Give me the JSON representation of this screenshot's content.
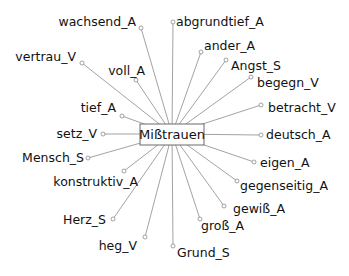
{
  "diagram": {
    "type": "collocation-network",
    "center": {
      "label": "Mißtrauen",
      "x": 172,
      "y": 134,
      "box": {
        "x": 140,
        "y": 124,
        "w": 64,
        "h": 21
      }
    },
    "colors": {
      "edge": "#8a8a8a",
      "node": "#8a8a8a",
      "text": "#111111",
      "box_border": "#6a6a6a"
    },
    "nodes": [
      {
        "label": "abgrundtief_A",
        "x": 173,
        "y": 22,
        "lx": 176,
        "ly": 26,
        "anchor": "start"
      },
      {
        "label": "wachsend_A",
        "x": 141,
        "y": 28,
        "lx": 136,
        "ly": 26,
        "anchor": "end"
      },
      {
        "label": "vertrau_V",
        "x": 82,
        "y": 63,
        "lx": 76,
        "ly": 61,
        "anchor": "end"
      },
      {
        "label": "voll_A",
        "x": 136,
        "y": 80,
        "lx": 145,
        "ly": 75,
        "anchor": "end"
      },
      {
        "label": "ander_A",
        "x": 201,
        "y": 52,
        "lx": 204,
        "ly": 50,
        "anchor": "start"
      },
      {
        "label": "Angst_S",
        "x": 226,
        "y": 60,
        "lx": 231,
        "ly": 70,
        "anchor": "start"
      },
      {
        "label": "begegn_V",
        "x": 251,
        "y": 77,
        "lx": 257,
        "ly": 87,
        "anchor": "start"
      },
      {
        "label": "betracht_V",
        "x": 261,
        "y": 105,
        "lx": 268,
        "ly": 112,
        "anchor": "start"
      },
      {
        "label": "tief_A",
        "x": 122,
        "y": 116,
        "lx": 116,
        "ly": 112,
        "anchor": "end"
      },
      {
        "label": "setz_V",
        "x": 103,
        "y": 134,
        "lx": 97,
        "ly": 138,
        "anchor": "end"
      },
      {
        "label": "deutsch_A",
        "x": 261,
        "y": 135,
        "lx": 266,
        "ly": 139,
        "anchor": "start"
      },
      {
        "label": "Mensch_S",
        "x": 88,
        "y": 158,
        "lx": 84,
        "ly": 162,
        "anchor": "end"
      },
      {
        "label": "eigen_A",
        "x": 254,
        "y": 162,
        "lx": 260,
        "ly": 167,
        "anchor": "start"
      },
      {
        "label": "konstruktiv_A",
        "x": 124,
        "y": 171,
        "lx": 138,
        "ly": 186,
        "anchor": "end"
      },
      {
        "label": "gegenseitig_A",
        "x": 237,
        "y": 181,
        "lx": 240,
        "ly": 190,
        "anchor": "start"
      },
      {
        "label": "Herz_S",
        "x": 113,
        "y": 219,
        "lx": 106,
        "ly": 224,
        "anchor": "end"
      },
      {
        "label": "gewiß_A",
        "x": 224,
        "y": 206,
        "lx": 233,
        "ly": 213,
        "anchor": "start"
      },
      {
        "label": "groß_A",
        "x": 200,
        "y": 219,
        "lx": 201,
        "ly": 230,
        "anchor": "start"
      },
      {
        "label": "heg_V",
        "x": 145,
        "y": 237,
        "lx": 137,
        "ly": 250,
        "anchor": "end"
      },
      {
        "label": "Grund_S",
        "x": 173,
        "y": 246,
        "lx": 177,
        "ly": 257,
        "anchor": "start"
      }
    ]
  }
}
